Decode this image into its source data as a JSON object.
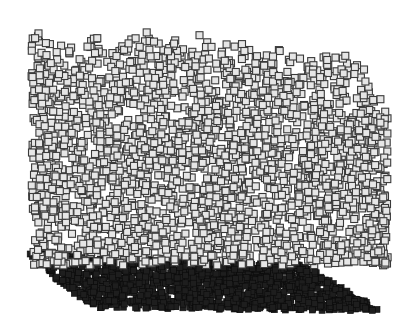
{
  "scene": {
    "description": "3D particle rendering: a loose cloud of light-filled square markers above a dense dark slab",
    "background": "#ffffff",
    "cloud": {
      "fill": "#e6e6e6",
      "stroke": "#3a3a3a",
      "marker": "square",
      "size": 7,
      "count": 2600,
      "x_range": [
        28,
        385
      ],
      "top_left_y": 20,
      "top_right_y": 40,
      "bottom_y": 262,
      "right_fade_x": 340
    },
    "slab": {
      "fill": "#1e1e1e",
      "stroke": "#0a0a0a",
      "marker": "square",
      "size": 6,
      "count": 1400,
      "corners": {
        "back_left": [
          25,
          250
        ],
        "back_right": [
          300,
          262
        ],
        "front_left": [
          85,
          305
        ],
        "front_right": [
          380,
          308
        ]
      }
    }
  }
}
